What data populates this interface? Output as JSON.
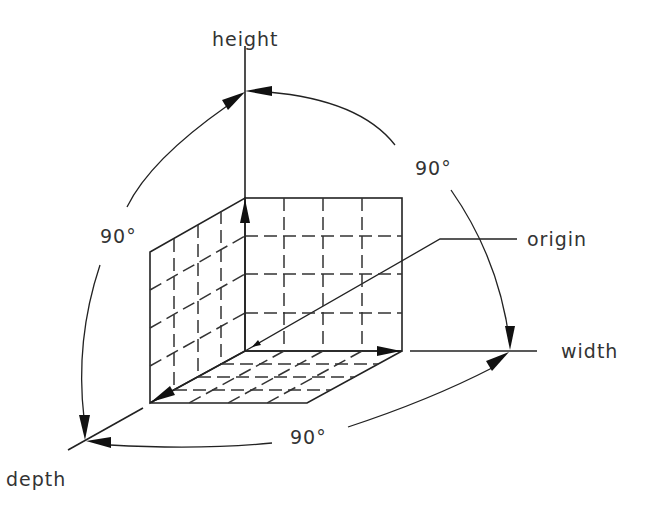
{
  "diagram": {
    "labels": {
      "height": "height",
      "width": "width",
      "depth": "depth",
      "origin": "origin",
      "angle_top_right": "90°",
      "angle_left": "90°",
      "angle_bottom": "90°"
    },
    "axes": [
      {
        "name": "height",
        "direction": "up"
      },
      {
        "name": "width",
        "direction": "right"
      },
      {
        "name": "depth",
        "direction": "down-left"
      }
    ],
    "angles_between_axes": [
      {
        "from": "height",
        "to": "width",
        "value": "90°"
      },
      {
        "from": "height",
        "to": "depth",
        "value": "90°"
      },
      {
        "from": "depth",
        "to": "width",
        "value": "90°"
      }
    ],
    "cube_grid": {
      "back_wall": "4x4",
      "side_wall": "4x4",
      "floor": "4x4"
    },
    "colors": {
      "line": "#222222",
      "text": "#333333",
      "background": "#ffffff"
    }
  }
}
